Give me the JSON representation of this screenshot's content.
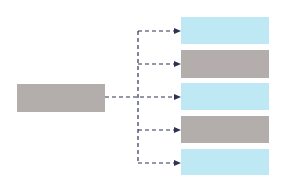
{
  "diagram": {
    "type": "one-to-many fan-out",
    "colors": {
      "gray_box": "#b3adab",
      "blue_box": "#bfe8f5",
      "connector": "#2f3257",
      "background": "#ffffff"
    },
    "source": {
      "label": "",
      "color": "gray"
    },
    "targets": [
      {
        "label": "",
        "color": "blue"
      },
      {
        "label": "",
        "color": "gray"
      },
      {
        "label": "",
        "color": "blue"
      },
      {
        "label": "",
        "color": "gray"
      },
      {
        "label": "",
        "color": "blue"
      }
    ],
    "connector_style": "dashed arrows"
  }
}
